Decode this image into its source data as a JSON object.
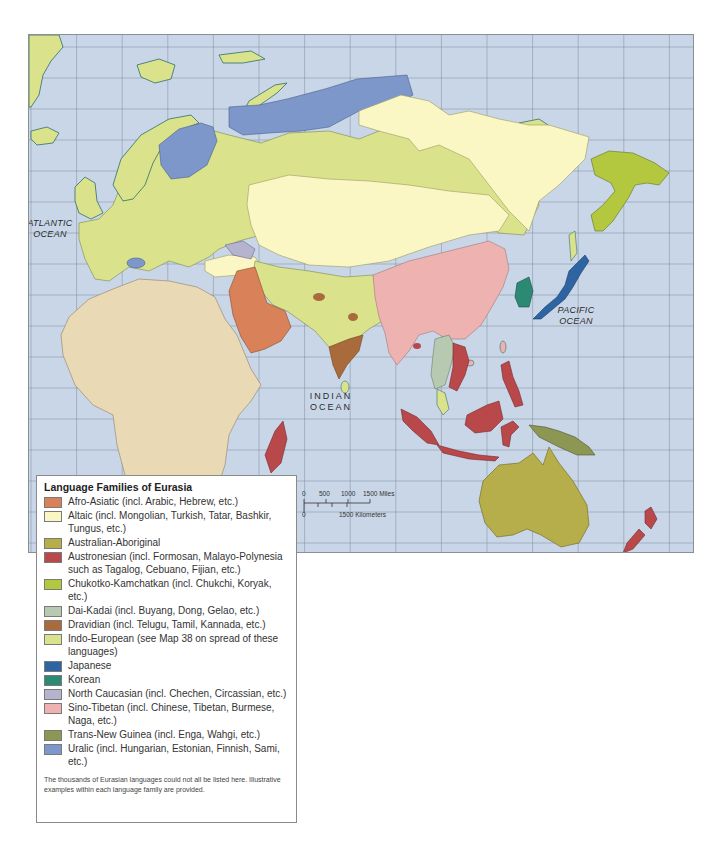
{
  "map": {
    "ocean_labels": {
      "atlantic": [
        "ATLANTIC",
        "OCEAN"
      ],
      "pacific": [
        "PACIFIC",
        "OCEAN"
      ],
      "indian": [
        "INDIAN",
        "OCEAN"
      ]
    },
    "colors": {
      "ocean": "#c9d6e8",
      "grid": "#7f8a99",
      "coast": "#2f6e6a"
    }
  },
  "scale": {
    "miles_ticks": [
      "0",
      "500",
      "1000",
      "1500 Miles"
    ],
    "km_ticks": [
      "0",
      "1500 Kilometers"
    ]
  },
  "legend": {
    "title": "Language Families of Eurasia",
    "items": [
      {
        "label": "Afro-Asiatic (incl. Arabic, Hebrew, etc.)",
        "color": "#d9825a"
      },
      {
        "label": "Altaic (incl. Mongolian, Turkish, Tatar, Bashkir, Tungus, etc.)",
        "color": "#fbf7c4"
      },
      {
        "label": "Australian-Aboriginal",
        "color": "#b5ae4a"
      },
      {
        "label": "Austronesian (incl. Formosan, Malayo-Polynesia such as Tagalog, Cebuano, Fijian, etc.)",
        "color": "#b9484a"
      },
      {
        "label": "Chukotko-Kamchatkan (incl. Chukchi, Koryak, etc.)",
        "color": "#b3c83f"
      },
      {
        "label": "Dai-Kadai (incl. Buyang, Dong, Gelao, etc.)",
        "color": "#b7c9b0"
      },
      {
        "label": "Dravidian (incl. Telugu, Tamil, Kannada, etc.)",
        "color": "#a96b3b"
      },
      {
        "label": "Indo-European (see Map 38 on spread of these languages)",
        "color": "#dbe28c"
      },
      {
        "label": "Japanese",
        "color": "#2f64a3"
      },
      {
        "label": "Korean",
        "color": "#2c8a74"
      },
      {
        "label": "North Caucasian (incl. Chechen, Circassian, etc.)",
        "color": "#b6b3cf"
      },
      {
        "label": "Sino-Tibetan (incl. Chinese, Tibetan, Burmese, Naga, etc.)",
        "color": "#eeb3b1"
      },
      {
        "label": "Trans-New Guinea (incl. Enga, Wahgi, etc.)",
        "color": "#8d9754"
      },
      {
        "label": "Uralic (incl. Hungarian, Estonian, Finnish, Sami, etc.)",
        "color": "#7d97cb"
      }
    ],
    "note": "The thousands of Eurasian languages could not all be listed here. Illustrative examples within each language family are provided."
  },
  "other_land_color": "#ead9b5"
}
